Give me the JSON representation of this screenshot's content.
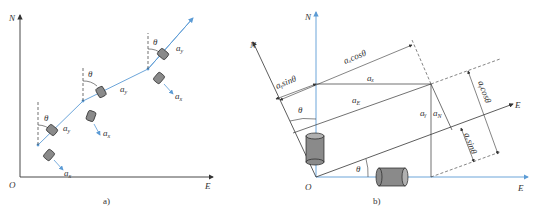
{
  "colors": {
    "axis_blue": "#5b9bd5",
    "line_dark": "#333333",
    "sensor_fill": "#8a8a8a",
    "sensor_stroke": "#222222"
  },
  "panel_a": {
    "caption": "a)",
    "axis_n": "N",
    "axis_e": "E",
    "origin": "O",
    "theta": "θ",
    "ax": "a",
    "ax_sub": "x",
    "ay": "a",
    "ay_sub": "y"
  },
  "panel_b": {
    "caption": "b)",
    "axis_n": "N",
    "axis_e": "E",
    "rot_axis_n": "N",
    "rot_axis_e": "E",
    "origin": "O",
    "theta": "θ",
    "ax_cos": "aₓcosθ",
    "ay_sin": "aᵧsinθ",
    "ax": "aₓ",
    "aE": "a",
    "aE_sub": "E",
    "ay": "aᵧ",
    "aN": "a",
    "aN_sub": "N",
    "ay_cos": "aᵧcosθ",
    "ax_sin": "aₓsinθ"
  }
}
